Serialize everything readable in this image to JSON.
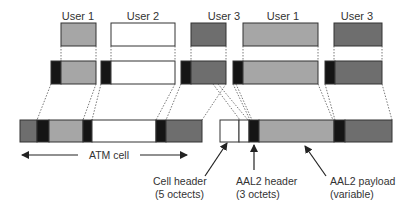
{
  "colors": {
    "light": "#a6a6a6",
    "dark": "#6e6e6e",
    "black": "#151515",
    "white": "#ffffff",
    "stroke": "#333333",
    "text": "#333333"
  },
  "users": [
    {
      "label": "User 1",
      "fill": "light"
    },
    {
      "label": "User 2",
      "fill": "white"
    },
    {
      "label": "User 3",
      "fill": "dark"
    },
    {
      "label": "User 1",
      "fill": "light"
    },
    {
      "label": "User 3",
      "fill": "dark"
    }
  ],
  "labels": {
    "atm_cell": "ATM cell",
    "cell_header_line1": "Cell header",
    "cell_header_line2": "(5 octects)",
    "aal2_header_line1": "AAL2 header",
    "aal2_header_line2": "(3 octets)",
    "aal2_payload_line1": "AAL2 payload",
    "aal2_payload_line2": "(variable)"
  }
}
